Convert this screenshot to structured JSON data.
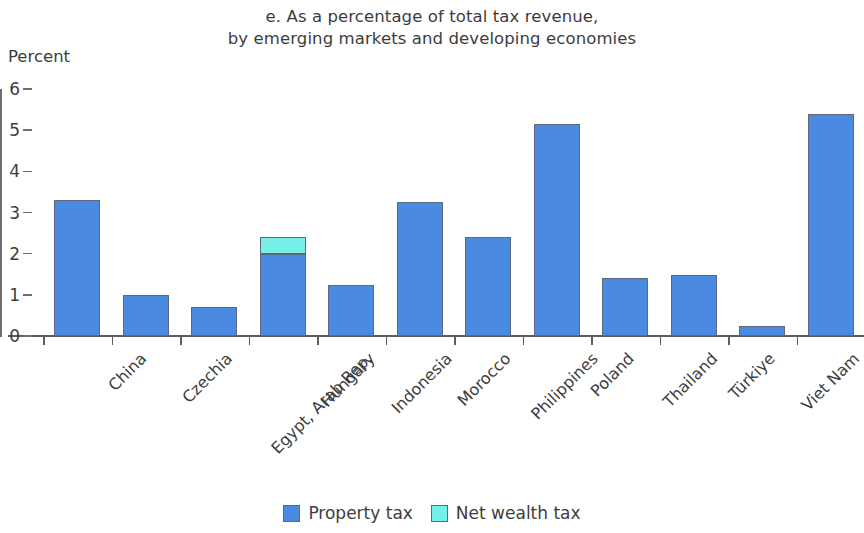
{
  "chart_data": {
    "type": "bar",
    "stacked": true,
    "title": "e. As a percentage of total tax revenue, by emerging markets and developing economies",
    "title_lines": [
      "e. As a percentage of total tax revenue,",
      "by emerging markets and developing economies"
    ],
    "xlabel": "",
    "ylabel": "Percent",
    "ylim": [
      0,
      6
    ],
    "yticks": [
      0,
      1,
      2,
      3,
      4,
      5,
      6
    ],
    "ytick_labels": [
      "0",
      "1",
      "2",
      "3",
      "4",
      "5",
      "6"
    ],
    "grid": false,
    "legend_position": "bottom",
    "categories": [
      "China",
      "Czechia",
      "Egypt, Arab Rep.",
      "Hungary",
      "Indonesia",
      "Morocco",
      "Philippines",
      "Poland",
      "Thailand",
      "Türkiye",
      "Viet Nam",
      "South Africa"
    ],
    "series": [
      {
        "name": "Property tax",
        "color": "#4a8ae0",
        "values": [
          3.3,
          1.0,
          0.7,
          2.0,
          1.25,
          3.25,
          2.4,
          5.15,
          1.42,
          1.48,
          0.25,
          5.4
        ]
      },
      {
        "name": "Net wealth tax",
        "color": "#77efe9",
        "values": [
          0,
          0,
          0,
          0.4,
          0,
          0,
          0,
          0,
          0,
          0,
          0,
          0
        ]
      }
    ]
  }
}
